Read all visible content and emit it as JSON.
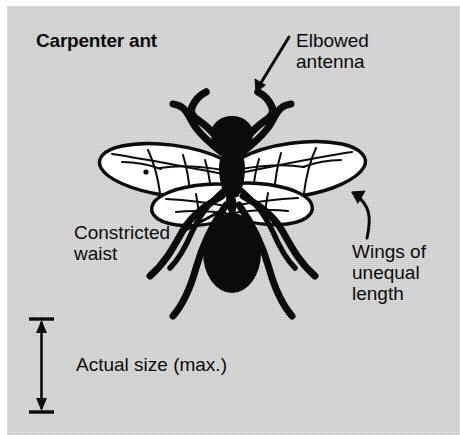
{
  "figure": {
    "title": "Carpenter ant",
    "background_color": "#c9c9c9",
    "ink_color": "#0b0b0b",
    "wing_fill_color": "#ffffff",
    "width": 460,
    "height": 435
  },
  "labels": {
    "elbowed_antenna": "Elbowed\nantenna",
    "constricted_waist": "Constricted\nwaist",
    "wings_unequal": "Wings of\nunequal\nlength",
    "actual_size": "Actual size (max.)"
  },
  "scale_bar": {
    "caption": "Actual size (max.)",
    "orientation": "vertical",
    "arrowheads": "double",
    "top_y": 318,
    "bottom_y": 412
  },
  "anatomy": {
    "parts": [
      "head",
      "elbowed-antenna-left",
      "elbowed-antenna-right",
      "thorax",
      "constricted-waist-petiole",
      "abdomen-gaster",
      "forewing-left",
      "hindwing-left",
      "forewing-right",
      "hindwing-right",
      "legs"
    ],
    "leg_count": 6,
    "wing_count": 4
  }
}
